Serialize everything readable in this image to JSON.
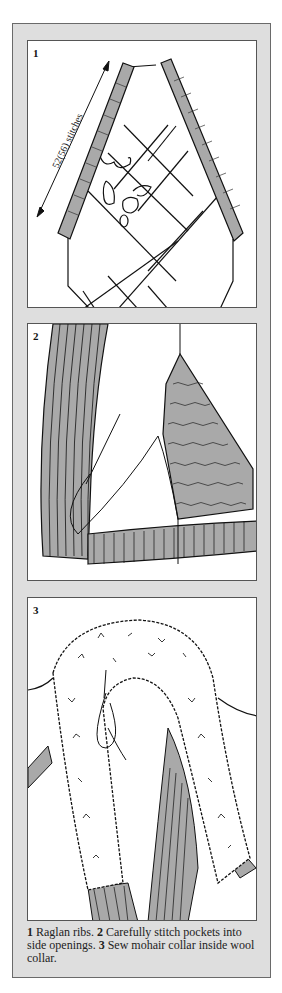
{
  "figure": {
    "panels": [
      {
        "number": "1",
        "label": "52(56) stitches"
      },
      {
        "number": "2"
      },
      {
        "number": "3"
      }
    ],
    "caption": {
      "step1_num": "1",
      "step1_text": " Raglan ribs. ",
      "step2_num": "2",
      "step2_text": " Carefully stitch pockets into side openings. ",
      "step3_num": "3",
      "step3_text": " Sew mohair collar inside wool collar."
    },
    "colors": {
      "frame": "#dedede",
      "rib": "#a9a9a9",
      "line": "#111111"
    }
  }
}
